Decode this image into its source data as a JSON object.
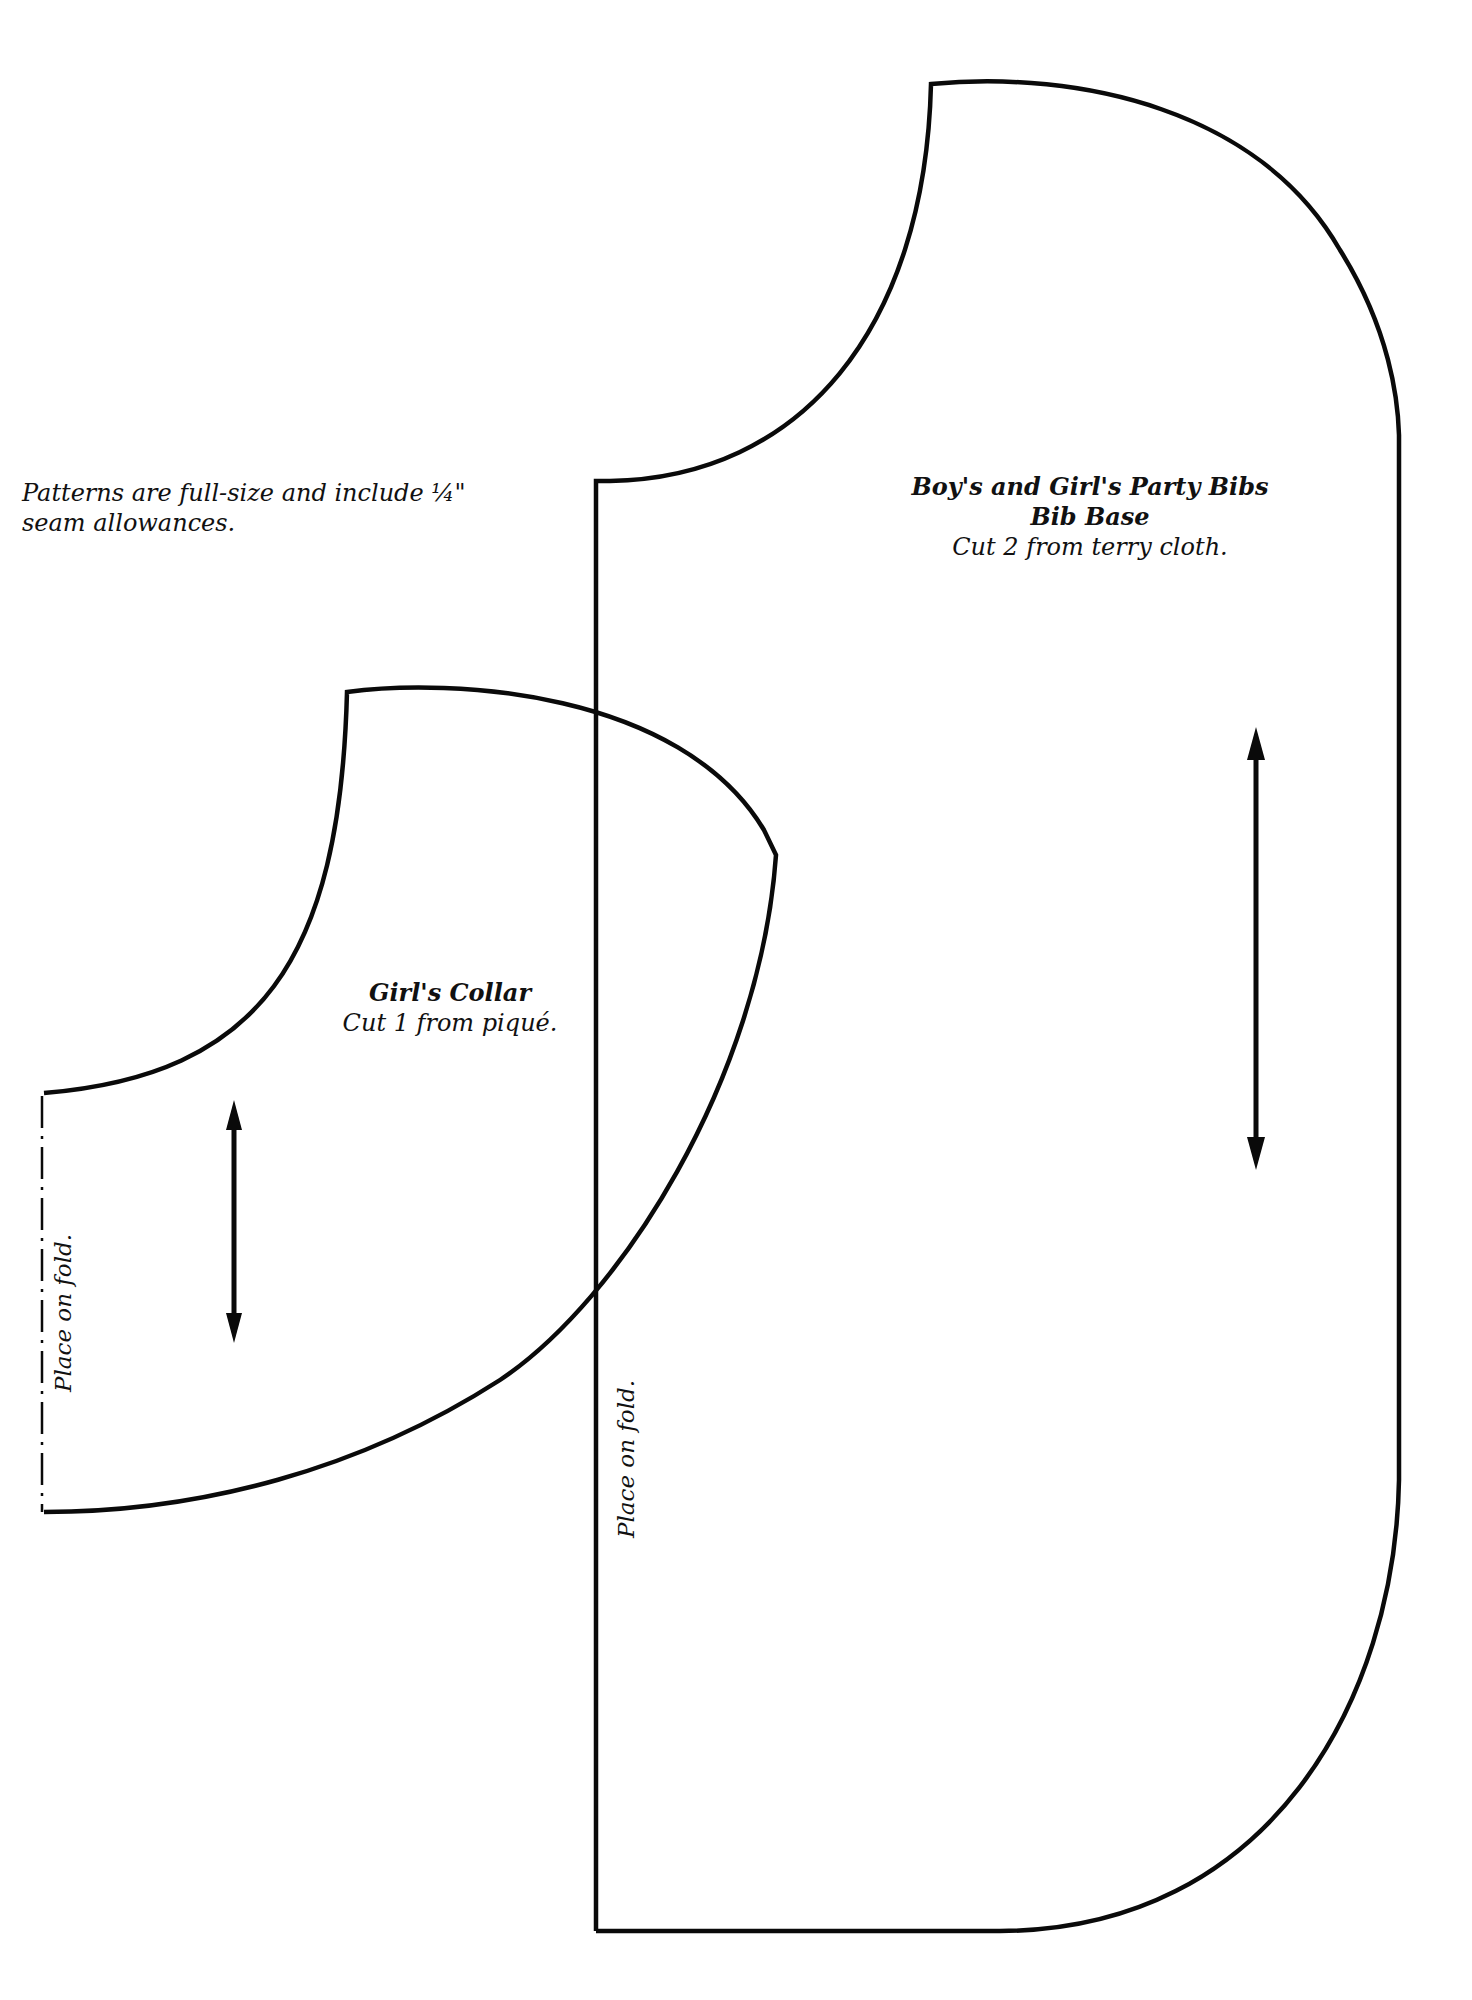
{
  "document": {
    "type": "sewing pattern sheet",
    "note": {
      "line1": "Patterns are full-size and include ¼\"",
      "line2": "seam allowances."
    },
    "pieces": [
      {
        "id": "bib-base",
        "title_line1": "Boy's and Girl's Party Bibs",
        "title_line2": "Bib Base",
        "instruction": "Cut 2 from terry cloth.",
        "fold_label": "Place on fold.",
        "grainline": "double-arrow-vertical"
      },
      {
        "id": "girls-collar",
        "title_line1": "Girl's Collar",
        "instruction": "Cut 1 from piqué.",
        "fold_label": "Place on fold.",
        "grainline": "double-arrow-vertical"
      }
    ],
    "icons": {
      "grainline": "double-headed-arrow",
      "fold_line": "dash-dot-line"
    },
    "colors": {
      "ink": "#0a0a0a",
      "paper": "#ffffff"
    }
  }
}
